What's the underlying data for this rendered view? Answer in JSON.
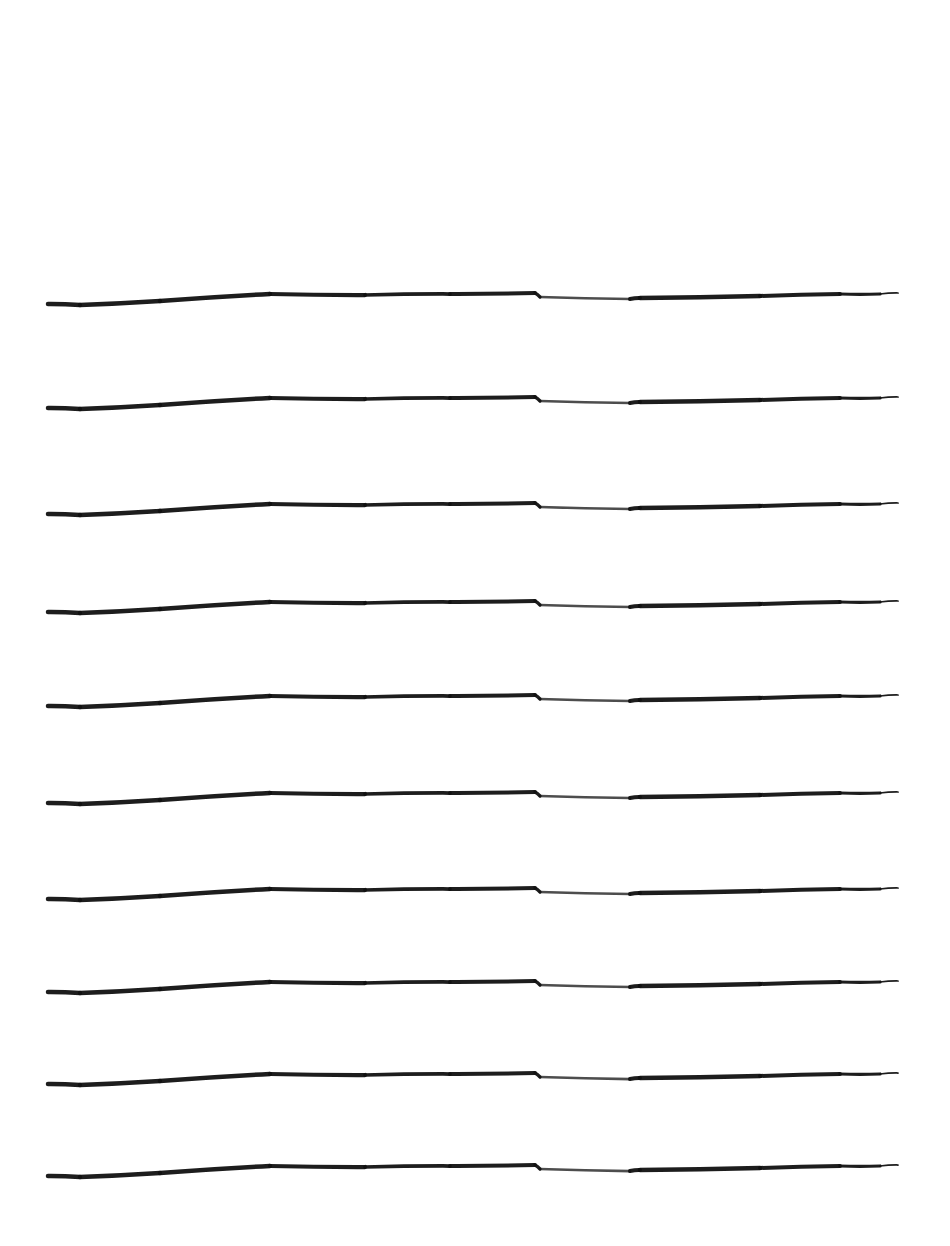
{
  "document": {
    "type": "lined-paper",
    "background_color": "#ffffff",
    "line_color": "#111111",
    "line_count": 10,
    "line_left_x": 48,
    "line_right_x": 898,
    "line_baselines_y": [
      298,
      402,
      508,
      606,
      700,
      797,
      893,
      986,
      1078,
      1170
    ]
  }
}
